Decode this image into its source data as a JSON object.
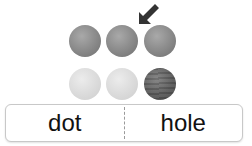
{
  "balls": [
    {
      "shade": "mid"
    },
    {
      "shade": "mid",
      "marked": true
    },
    {
      "shade": "mid"
    },
    {
      "shade": "light"
    },
    {
      "shade": "light"
    },
    {
      "shade": "dark"
    }
  ],
  "pointer": {
    "icon": "arrow-down-left-icon",
    "target_index": 1,
    "color": "#333333"
  },
  "choices": {
    "left": "dot",
    "right": "hole"
  },
  "colors": {
    "mid": "#8e8e8e",
    "light": "#dcdcdc",
    "dark": "#5f5f5f",
    "border": "#c8c8c8"
  }
}
